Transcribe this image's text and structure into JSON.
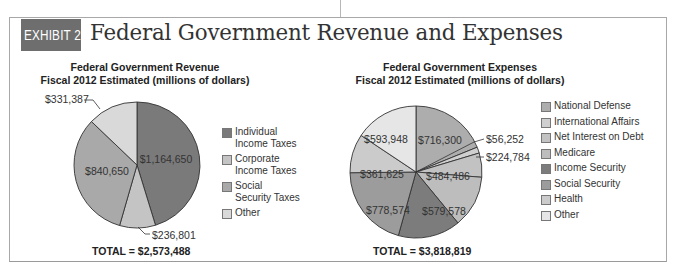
{
  "exhibit": {
    "tag": "EXHIBIT 2.2",
    "title": "Federal Government Revenue and Expenses",
    "tag_color": "#6e6e6e"
  },
  "chart_data": [
    {
      "type": "pie",
      "title": "Federal Government Revenue",
      "subtitle": "Fiscal 2012 Estimated (millions of dollars)",
      "unit": "millions of dollars",
      "total_label": "TOTAL = $2,573,488",
      "total": 2573488,
      "legend_position": "right",
      "slices": [
        {
          "name": "Individual Income Taxes",
          "legend_lines": [
            "Individual",
            "Income Taxes"
          ],
          "value": 1164650,
          "label": "$1,164,650",
          "color": "#7a7a7a"
        },
        {
          "name": "Corporate Income Taxes",
          "legend_lines": [
            "Corporate",
            "Income Taxes"
          ],
          "value": 236801,
          "label": "$236,801",
          "color": "#c4c4c4"
        },
        {
          "name": "Social Security Taxes",
          "legend_lines": [
            "Social",
            "Security Taxes"
          ],
          "value": 840650,
          "label": "$840,650",
          "color": "#a9a9a9"
        },
        {
          "name": "Other",
          "legend_lines": [
            "Other"
          ],
          "value": 331387,
          "label": "$331,387",
          "color": "#d9d9d9"
        }
      ]
    },
    {
      "type": "pie",
      "title": "Federal Government Expenses",
      "subtitle": "Fiscal 2012 Estimated (millions of dollars)",
      "unit": "millions of dollars",
      "total_label": "TOTAL = $3,818,819",
      "total": 3818819,
      "legend_position": "right",
      "slices": [
        {
          "name": "National Defense",
          "value": 716300,
          "label": "$716,300",
          "color": "#adadad"
        },
        {
          "name": "International Affairs",
          "value": 56252,
          "label": "$56,252",
          "color": "#cfcfcf"
        },
        {
          "name": "Net Interest on Debt",
          "value": 224784,
          "label": "$224,784",
          "color": "#c2c2c2"
        },
        {
          "name": "Medicare",
          "value": 484486,
          "label": "$484,486",
          "color": "#bdbdbd"
        },
        {
          "name": "Income Security",
          "value": 579578,
          "label": "$579,578",
          "color": "#7c7c7c"
        },
        {
          "name": "Social Security",
          "value": 778574,
          "label": "$778,574",
          "color": "#9c9c9c"
        },
        {
          "name": "Health",
          "value": 361625,
          "label": "$361,625",
          "color": "#cbcbcb"
        },
        {
          "name": "Other",
          "value": 593948,
          "label": "$593,948",
          "color": "#e6e6e6"
        }
      ]
    }
  ]
}
